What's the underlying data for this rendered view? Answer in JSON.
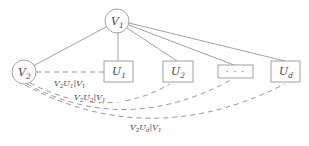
{
  "figure": {
    "type": "graph-diagram",
    "background_color": "#ffffff",
    "stroke_color": "#8a8a8a",
    "text_color": "#4a4a4a",
    "width": 309,
    "height": 146
  },
  "nodes": {
    "root": {
      "id": "V1",
      "shape": "circle",
      "base": "V",
      "subscript": "1",
      "cx": 117,
      "cy": 21,
      "r": 12
    },
    "left": {
      "id": "V2",
      "shape": "circle",
      "base": "V",
      "subscript": "2",
      "cx": 24,
      "cy": 72,
      "r": 12
    },
    "boxes": [
      {
        "id": "U1",
        "shape": "rect",
        "base": "U",
        "subscript": "1",
        "x": 104,
        "y": 61,
        "w": 29,
        "h": 21
      },
      {
        "id": "U2",
        "shape": "rect",
        "base": "U",
        "subscript": "2",
        "x": 163,
        "y": 61,
        "w": 30,
        "h": 21
      },
      {
        "id": "Uellipsis",
        "shape": "rect",
        "base": "⋯",
        "subscript": "",
        "x": 218,
        "y": 65,
        "w": 35,
        "h": 13
      },
      {
        "id": "Ud",
        "shape": "rect",
        "base": "U",
        "subscript": "d",
        "x": 271,
        "y": 61,
        "w": 29,
        "h": 21
      }
    ]
  },
  "tree_edges": [
    {
      "name": "V1-V2",
      "from": "V1",
      "to": "V2",
      "style": "solid"
    },
    {
      "name": "V1-U1",
      "from": "V1",
      "to": "U1",
      "style": "solid"
    },
    {
      "name": "V1-U2",
      "from": "V1",
      "to": "U2",
      "style": "solid"
    },
    {
      "name": "V1-Uellipsis",
      "from": "V1",
      "to": "Uellipsis",
      "style": "solid"
    },
    {
      "name": "V1-Ud",
      "from": "V1",
      "to": "Ud",
      "style": "solid"
    }
  ],
  "conditional_edges": [
    {
      "name": "V2-U1",
      "from": "V2",
      "to": "U1",
      "style": "dashed",
      "label_base": "V",
      "label_text": "V2U1|V1",
      "label_x": 76,
      "label_y": 86
    },
    {
      "name": "V2-U2",
      "from": "V2",
      "to": "U2",
      "style": "dashed",
      "label_text": "V2U2|V1",
      "label_x": 96,
      "label_y": 100
    },
    {
      "name": "V2-Uellipsis",
      "from": "V2",
      "to": "Uellipsis",
      "style": "dashed",
      "label_text": "",
      "label_x": 0,
      "label_y": 0
    },
    {
      "name": "V2-Ud",
      "from": "V2",
      "to": "Ud",
      "style": "dashed",
      "label_text": "V2Ud|V1",
      "label_x": 150,
      "label_y": 130
    }
  ],
  "edge_labels": [
    {
      "id": "label-v2u1",
      "v": "V",
      "v_sub": "2",
      "u": "U",
      "u_sub": "1",
      "bar": "|",
      "cond": "V",
      "cond_sub": "1",
      "full": "V2U1|V1"
    },
    {
      "id": "label-v2u2",
      "v": "V",
      "v_sub": "2",
      "u": "U",
      "u_sub": "2",
      "bar": "|",
      "cond": "V",
      "cond_sub": "1",
      "full": "V2U2|V1"
    },
    {
      "id": "label-v2ud",
      "v": "V",
      "v_sub": "2",
      "u": "U",
      "u_sub": "d",
      "bar": "|",
      "cond": "V",
      "cond_sub": "1",
      "full": "V2Ud|V1"
    }
  ],
  "ellipsis": {
    "glyph": "· · ·"
  }
}
